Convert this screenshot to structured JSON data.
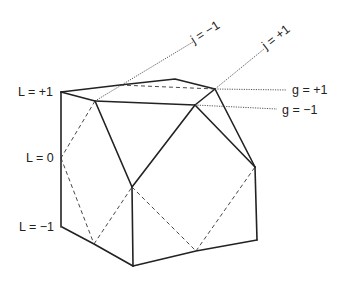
{
  "figure": {
    "type": "polyhedron",
    "labels": {
      "L_plus1": "L = +1",
      "L_zero": "L = 0",
      "L_minus1": "L = −1",
      "g_plus1": "g = +1",
      "g_minus1": "g = −1",
      "j_minus1": "j = −1",
      "j_plus1": "j = +1"
    },
    "vertices": {
      "A": [
        61,
        92
      ],
      "B": [
        61,
        158
      ],
      "C": [
        62,
        227
      ],
      "D": [
        95,
        101
      ],
      "E": [
        120,
        85
      ],
      "F": [
        175,
        79
      ],
      "G": [
        215,
        89
      ],
      "H": [
        195,
        105
      ],
      "I": [
        132,
        187
      ],
      "J": [
        94,
        244
      ],
      "K": [
        133,
        266
      ],
      "M": [
        196,
        251
      ],
      "N": [
        257,
        240
      ],
      "O": [
        255,
        167
      ]
    },
    "colors": {
      "line": "#222222",
      "background": "#ffffff"
    }
  }
}
